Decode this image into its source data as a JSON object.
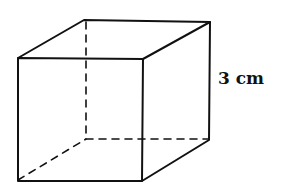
{
  "diagram": {
    "type": "cube",
    "edge_label": "3 cm",
    "colors": {
      "stroke": "#111111",
      "background": "#ffffff"
    }
  }
}
